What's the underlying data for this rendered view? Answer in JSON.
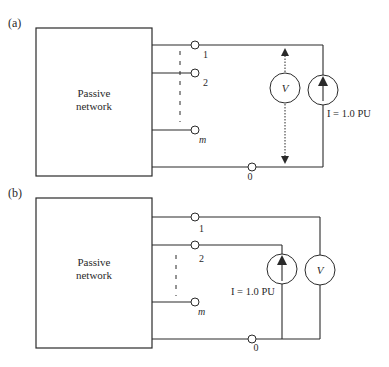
{
  "diagram_a": {
    "panel_label": "(a)",
    "network_label_line1": "Passive",
    "network_label_line2": "network",
    "terminals": [
      "1",
      "2",
      "m",
      "0"
    ],
    "voltmeter_label": "V",
    "current_source_label": "I = 1.0 PU"
  },
  "diagram_b": {
    "panel_label": "(b)",
    "network_label_line1": "Passive",
    "network_label_line2": "network",
    "terminals": [
      "1",
      "2",
      "m",
      "0"
    ],
    "voltmeter_label": "V",
    "current_source_label": "I = 1.0 PU"
  }
}
